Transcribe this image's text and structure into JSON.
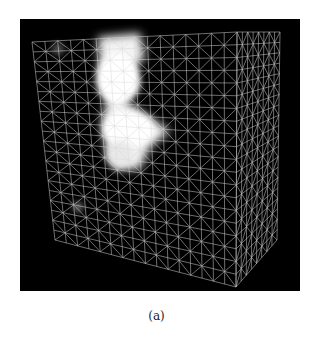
{
  "figure": {
    "caption": "(a)",
    "colors": {
      "background": "#000000",
      "mesh": "#d8d8d8",
      "volume": "#ffffff",
      "page": "#ffffff"
    }
  }
}
